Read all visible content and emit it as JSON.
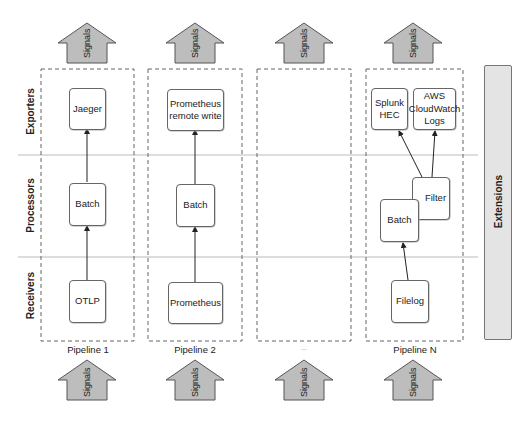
{
  "diagram": {
    "lanes": [
      {
        "id": "exporters",
        "label": "Exporters"
      },
      {
        "id": "processors",
        "label": "Processors"
      },
      {
        "id": "receivers",
        "label": "Receivers"
      }
    ],
    "signal_label": "Signals",
    "extensions_label": "Extensions",
    "pipelines": [
      {
        "label": "Pipeline 1",
        "exporters": [
          "Jaeger"
        ],
        "processors": [
          "Batch"
        ],
        "receivers": [
          "OTLP"
        ]
      },
      {
        "label": "Pipeline 2",
        "exporters": [
          "Prometheus remote write"
        ],
        "processors": [
          "Batch"
        ],
        "receivers": [
          "Prometheus"
        ]
      },
      {
        "label": "...",
        "exporters": [],
        "processors": [],
        "receivers": []
      },
      {
        "label": "Pipeline N",
        "exporters": [
          "Splunk HEC",
          "AWS CloudWatch Logs"
        ],
        "processors": [
          "Batch",
          "Filter"
        ],
        "receivers": [
          "Filelog"
        ]
      }
    ],
    "colors": {
      "arrow_fill": "#bdbdbd",
      "arrow_stroke": "#555555",
      "extensions_fill": "#e4e4e4",
      "dash_stroke": "#666666",
      "lane_divider": "#bbbbbb"
    }
  }
}
